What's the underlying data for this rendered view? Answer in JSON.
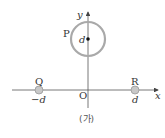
{
  "diagram": {
    "caption": "(가)",
    "axes": {
      "x_label": "x",
      "y_label": "y",
      "origin_label": "O"
    },
    "ring_P": {
      "label": "P",
      "center_label": "d",
      "stroke_color": "#a9a9a9"
    },
    "charge_Q": {
      "label": "Q",
      "position_label": "−d",
      "fill_color": "#c8c8c8"
    },
    "charge_R": {
      "label": "R",
      "position_label": "d",
      "fill_color": "#c8c8c8"
    }
  }
}
